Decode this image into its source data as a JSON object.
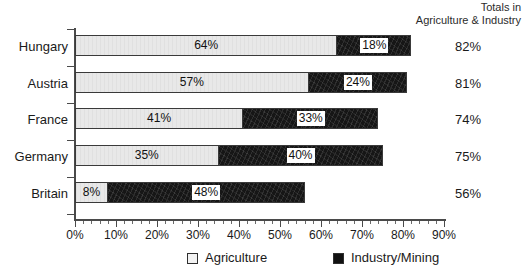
{
  "header": {
    "line1": "Totals in",
    "line2": "Agriculture & Industry"
  },
  "legend": {
    "items": [
      {
        "label": "Agriculture",
        "swatch": "light-square-swatch",
        "color": "#f2f2f2"
      },
      {
        "label": "Industry/Mining",
        "swatch": "dark-square-swatch",
        "color": "#111111"
      }
    ]
  },
  "axis": {
    "x_ticks": [
      "0%",
      "10%",
      "20%",
      "30%",
      "40%",
      "50%",
      "60%",
      "70%",
      "80%",
      "90%"
    ]
  },
  "rows": [
    {
      "country": "Hungary",
      "agriculture_label": "64%",
      "industry_label": "18%",
      "total_label": "82%"
    },
    {
      "country": "Austria",
      "agriculture_label": "57%",
      "industry_label": "24%",
      "total_label": "81%"
    },
    {
      "country": "France",
      "agriculture_label": "41%",
      "industry_label": "33%",
      "total_label": "74%"
    },
    {
      "country": "Germany",
      "agriculture_label": "35%",
      "industry_label": "40%",
      "total_label": "75%"
    },
    {
      "country": "Britain",
      "agriculture_label": "8%",
      "industry_label": "48%",
      "total_label": "56%"
    }
  ],
  "chart_data": {
    "type": "bar",
    "orientation": "horizontal",
    "stacked": true,
    "title": "",
    "subtitle": "",
    "xlabel": "",
    "ylabel": "",
    "categories": [
      "Hungary",
      "Austria",
      "France",
      "Germany",
      "Britain"
    ],
    "series": [
      {
        "name": "Agriculture",
        "values": [
          64,
          57,
          41,
          35,
          8
        ],
        "color": "#e8e8e8"
      },
      {
        "name": "Industry/Mining",
        "values": [
          18,
          24,
          33,
          40,
          48
        ],
        "color": "#161616"
      }
    ],
    "totals": {
      "label_line1": "Totals in",
      "label_line2": "Agriculture & Industry",
      "values": [
        82,
        81,
        74,
        75,
        56
      ]
    },
    "xlim": [
      0,
      90
    ],
    "x_tick_values": [
      0,
      10,
      20,
      30,
      40,
      50,
      60,
      70,
      80,
      90
    ],
    "x_tick_labels": [
      "0%",
      "10%",
      "20%",
      "30%",
      "40%",
      "50%",
      "60%",
      "70%",
      "80%",
      "90%"
    ],
    "x_minor_ticks_between": 4,
    "unit": "percent",
    "grid": false,
    "legend_position": "bottom",
    "legend_entries": [
      "Agriculture",
      "Industry/Mining"
    ]
  },
  "geometry": {
    "x0_px": 75,
    "px_per_percent": 4.1,
    "row_tops": [
      35,
      72,
      108,
      145,
      182
    ],
    "label_tops": [
      40,
      77,
      113,
      150,
      187
    ],
    "ytick_tops": [
      29,
      66,
      103,
      140,
      177,
      214
    ]
  }
}
